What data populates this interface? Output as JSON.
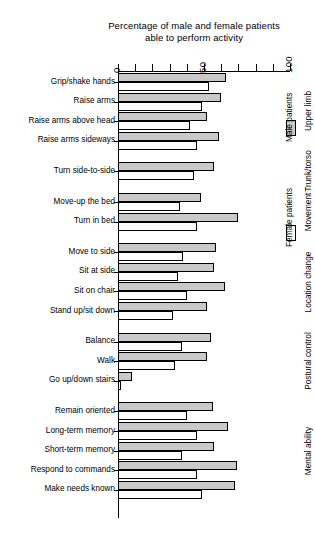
{
  "chart_data": {
    "type": "bar",
    "title": "Percentage of male and female patients able to perform activity",
    "title_line1": "Percentage of male and female patients",
    "title_line2": "able to perform  activity",
    "orientation": "horizontal",
    "xlabel": "",
    "ylabel": "",
    "xlim": [
      0,
      100
    ],
    "xticks": [
      0,
      10,
      20,
      30,
      40,
      50,
      60,
      70,
      80,
      90,
      100
    ],
    "xtick_labels": [
      "0",
      "50",
      "100"
    ],
    "xtick_label_values": [
      0,
      50,
      100
    ],
    "grid": false,
    "legend_position": "right",
    "series": [
      {
        "name": "Male patients",
        "color": "#c9c9c9",
        "values": [
          63,
          60,
          52,
          59,
          56,
          48,
          70,
          57,
          56,
          62,
          52,
          54,
          52,
          8,
          55,
          64,
          56,
          69,
          68
        ]
      },
      {
        "name": "Female patients",
        "color": "#ffffff",
        "values": [
          53,
          49,
          42,
          46,
          44,
          36,
          46,
          38,
          35,
          40,
          32,
          37,
          33,
          2,
          40,
          46,
          37,
          46,
          49
        ]
      }
    ],
    "categories": [
      "Grip/shake hands",
      "Raise arms",
      "Raise arms above head",
      "Raise arms sideways",
      "Turn side-to-side",
      "Move-up the bed",
      "Turn in bed",
      "Move to side",
      "Sit at side",
      "Sit on chair",
      "Stand up/sit down",
      "Balance",
      "Walk",
      "Go up/down stairs",
      "Remain oriented",
      "Long-term memory",
      "Short-term memory",
      "Respond to commands",
      "Make needs known"
    ],
    "groups": [
      {
        "label": "Upper limb mobility",
        "label_line1": "Upper limb",
        "label_line2": "mobility",
        "categories": [
          "Grip/shake hands",
          "Raise arms",
          "Raise arms above head",
          "Raise arms sideways"
        ]
      },
      {
        "label": "Trunk/torso mobility",
        "label_line1": "Trunk/torso",
        "label_line2": "mobility",
        "categories": [
          "Turn side-to-side"
        ]
      },
      {
        "label": "Movement in bed",
        "label_line1": "Movement",
        "label_line2": "in bed",
        "categories": [
          "Move-up the bed",
          "Turn in bed"
        ]
      },
      {
        "label": "Location change",
        "label_line1": "Location change",
        "label_line2": "",
        "categories": [
          "Move to side",
          "Sit at side",
          "Sit on chair",
          "Stand up/sit down"
        ]
      },
      {
        "label": "Postural control",
        "label_line1": "Postural control",
        "label_line2": "",
        "categories": [
          "Balance",
          "Walk",
          "Go up/down stairs"
        ]
      },
      {
        "label": "Mental ability",
        "label_line1": "Mental ability",
        "label_line2": "",
        "categories": [
          "Remain oriented",
          "Long-term memory",
          "Short-term memory",
          "Respond to commands",
          "Make needs known"
        ]
      }
    ]
  },
  "legend": {
    "male_label": "Male patients",
    "female_label": "Female patients"
  }
}
